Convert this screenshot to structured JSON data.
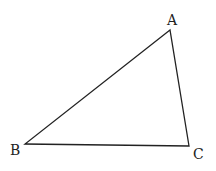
{
  "diagram": {
    "type": "triangle",
    "vertices": [
      {
        "label": "A",
        "x": 170,
        "y": 30,
        "label_x": 167,
        "label_y": 25
      },
      {
        "label": "B",
        "x": 25,
        "y": 144,
        "label_x": 10,
        "label_y": 155
      },
      {
        "label": "C",
        "x": 189,
        "y": 146,
        "label_x": 193,
        "label_y": 159
      }
    ],
    "edges": [
      [
        "A",
        "B"
      ],
      [
        "B",
        "C"
      ],
      [
        "C",
        "A"
      ]
    ],
    "stroke_color": "#222222",
    "background": "#ffffff"
  }
}
